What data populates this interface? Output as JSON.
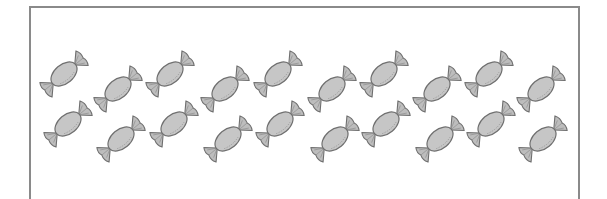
{
  "scene": {
    "description": "Counting picture: wrapped candies inside a rectangular frame",
    "frame": {
      "border_color": "#8a8a8a",
      "background": "#ffffff"
    },
    "candy_style": {
      "fill": "#c6c6c6",
      "stroke": "#6f6f6f",
      "wrapper_fill": "#bdbdbd"
    },
    "candy_count": 20,
    "candies": [
      {
        "x": 64,
        "y": 74
      },
      {
        "x": 118,
        "y": 89
      },
      {
        "x": 170,
        "y": 74
      },
      {
        "x": 225,
        "y": 89
      },
      {
        "x": 278,
        "y": 74
      },
      {
        "x": 332,
        "y": 89
      },
      {
        "x": 384,
        "y": 74
      },
      {
        "x": 437,
        "y": 89
      },
      {
        "x": 489,
        "y": 74
      },
      {
        "x": 541,
        "y": 89
      },
      {
        "x": 68,
        "y": 124
      },
      {
        "x": 121,
        "y": 139
      },
      {
        "x": 174,
        "y": 124
      },
      {
        "x": 228,
        "y": 139
      },
      {
        "x": 280,
        "y": 124
      },
      {
        "x": 335,
        "y": 139
      },
      {
        "x": 386,
        "y": 124
      },
      {
        "x": 440,
        "y": 139
      },
      {
        "x": 491,
        "y": 124
      },
      {
        "x": 543,
        "y": 139
      }
    ]
  }
}
